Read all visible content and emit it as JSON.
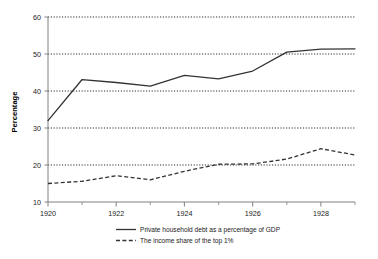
{
  "chart_data": {
    "type": "line",
    "title": "",
    "xlabel": "",
    "ylabel": "Percentage",
    "x": [
      1920,
      1921,
      1922,
      1923,
      1924,
      1925,
      1926,
      1927,
      1928,
      1929
    ],
    "xlim": [
      1920,
      1929
    ],
    "ylim": [
      10,
      60
    ],
    "xticks": [
      1920,
      1922,
      1924,
      1926,
      1928
    ],
    "xtick_labels": [
      "1920",
      "1922",
      "1924",
      "1926",
      "1928"
    ],
    "xminorticks": [
      1921,
      1923,
      1925,
      1927,
      1929
    ],
    "yticks": [
      10,
      20,
      30,
      40,
      50,
      60
    ],
    "ytick_labels": [
      "10",
      "20",
      "30",
      "40",
      "50",
      "60"
    ],
    "grid": "horizontal-dotted",
    "legend_position": "bottom-center",
    "series": [
      {
        "name": "Private household debt as a percentage of GDP",
        "style": "solid",
        "color": "#333333",
        "values": [
          32.0,
          43.1,
          42.3,
          41.3,
          44.2,
          43.3,
          45.4,
          50.5,
          51.3,
          51.4
        ]
      },
      {
        "name": "The income share of the top 1%",
        "style": "dashed",
        "color": "#333333",
        "values": [
          15.0,
          15.6,
          17.1,
          16.0,
          18.3,
          20.2,
          20.3,
          21.6,
          24.4,
          22.7
        ]
      }
    ]
  },
  "legend": {
    "items": [
      {
        "label": "Private household debt as a percentage of GDP",
        "style": "solid"
      },
      {
        "label": "The income share of the top 1%",
        "style": "dashed"
      }
    ]
  },
  "axes": {
    "y_title": "Percentage"
  }
}
